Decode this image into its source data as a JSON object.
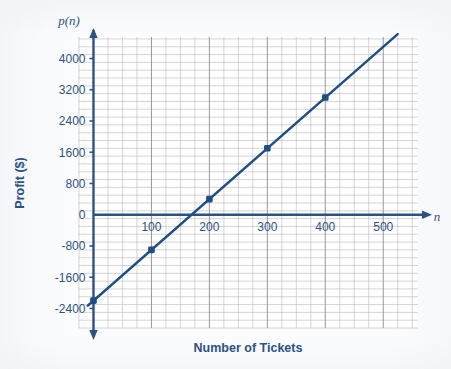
{
  "figure": {
    "colors": {
      "line": "#1f4e87",
      "axis": "#2b5286",
      "grid_minor": "#b9b9b9",
      "grid_major": "#8d8d8d",
      "text": "#2b5286",
      "background": "#fbfcfd",
      "plot_background": "#ffffff"
    },
    "axis_names": {
      "y": "p(n)",
      "x": "n"
    }
  },
  "chart_data": {
    "type": "line",
    "title": "",
    "subtitle": "",
    "xlabel": "Number of Tickets",
    "ylabel": "Profit ($)",
    "y_axis_name": "p(n)",
    "x_axis_name": "n",
    "xlim": [
      -25,
      560
    ],
    "ylim": [
      -2900,
      4550
    ],
    "xticks": [
      100,
      200,
      300,
      400,
      500
    ],
    "xtick_labels": [
      "100",
      "200",
      "300",
      "400",
      "500"
    ],
    "yticks": [
      -2400,
      -1600,
      -800,
      0,
      800,
      1600,
      2400,
      3200,
      4000
    ],
    "ytick_labels": [
      "-2400",
      "-1600",
      "-800",
      "0",
      "800",
      "1600",
      "2400",
      "3200",
      "4000"
    ],
    "grid": true,
    "grid_minor_step_x": 25,
    "grid_minor_step_y": 200,
    "grid_major_step_x": 100,
    "grid_major_step_y": 800,
    "legend": null,
    "annotations": [],
    "series": [
      {
        "name": "p(n)",
        "type": "line",
        "color": "#1f4e87",
        "slope": 13,
        "intercept": -2200,
        "x_intercept": 169,
        "line_endpoints": [
          {
            "x": -10,
            "y": -2330
          },
          {
            "x": 525,
            "y": 4625
          }
        ],
        "markers": [
          {
            "x": 0,
            "y": -2200,
            "label": "(0, -2200)"
          },
          {
            "x": 100,
            "y": -900,
            "label": "(100, -900)"
          },
          {
            "x": 200,
            "y": 400,
            "label": "(200, 400)"
          },
          {
            "x": 300,
            "y": 1700,
            "label": "(300, 1700)"
          },
          {
            "x": 400,
            "y": 3000,
            "label": "(400, 3000)"
          }
        ],
        "x": [
          0,
          100,
          200,
          300,
          400
        ],
        "values": [
          -2200,
          -900,
          400,
          1700,
          3000
        ]
      }
    ]
  }
}
